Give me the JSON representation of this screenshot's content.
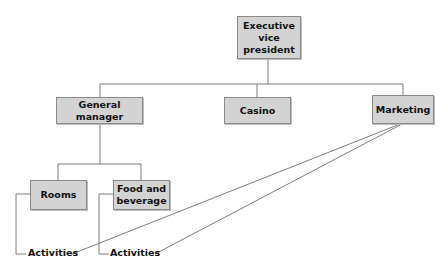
{
  "diagram": {
    "type": "org-chart",
    "line_color": "#6e6e6e",
    "box_fill": "#d3d3d3",
    "box_border": "#8a8a8a",
    "nodes": {
      "executive_vp": {
        "line1": "Executive",
        "line2": "vice president"
      },
      "general_manager": {
        "label": "General manager"
      },
      "casino": {
        "label": "Casino"
      },
      "marketing": {
        "label": "Marketing"
      },
      "rooms": {
        "label": "Rooms"
      },
      "food_beverage": {
        "line1": "Food and",
        "line2": "beverage"
      }
    },
    "activities": [
      {
        "label": "Activities",
        "parent": "Rooms",
        "also_linked_to": "Marketing"
      },
      {
        "label": "Activities",
        "parent": "Food and beverage",
        "also_linked_to": "Marketing"
      }
    ],
    "edges": [
      [
        "Executive vice president",
        "General manager"
      ],
      [
        "Executive vice president",
        "Casino"
      ],
      [
        "Executive vice president",
        "Marketing"
      ],
      [
        "General manager",
        "Rooms"
      ],
      [
        "General manager",
        "Food and beverage"
      ],
      [
        "Rooms",
        "Activities (1)"
      ],
      [
        "Food and beverage",
        "Activities (2)"
      ],
      [
        "Marketing",
        "Activities (1)"
      ],
      [
        "Marketing",
        "Activities (2)"
      ]
    ]
  }
}
